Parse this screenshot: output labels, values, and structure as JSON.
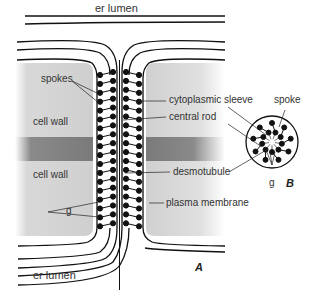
{
  "labels": {
    "er_lumen_top": "er lumen",
    "er_lumen_bottom": "er lumen",
    "spokes": "spokes",
    "cell_wall_top": "cell wall",
    "cell_wall_bottom": "cell wall",
    "g_left": "g",
    "cytoplasmic_sleeve": "cytoplasmic sleeve",
    "central_rod": "central rod",
    "desmotubule": "desmotubule",
    "plasma_membrane": "plasma membrane",
    "spoke": "spoke",
    "g_right": "g"
  },
  "panels": {
    "a": "A",
    "b": "B"
  },
  "colors": {
    "cell_wall": "#d6d6d6",
    "middle_lamella": "#8c8c8c",
    "line": "#111111",
    "bead": "#111111"
  }
}
